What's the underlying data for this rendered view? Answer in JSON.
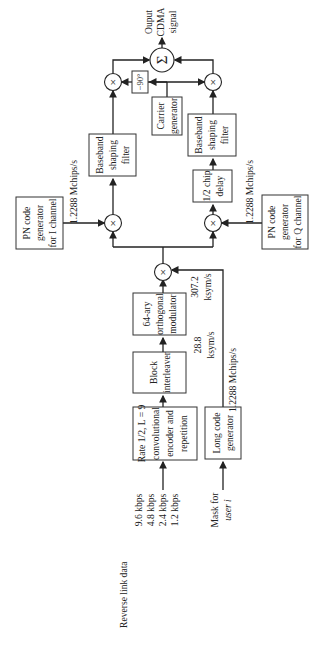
{
  "diagram": {
    "inputs": {
      "reverse_link_label": "Reverse link data",
      "rates": [
        "9.6 kbps",
        "4.8 kbps",
        "2.4 kbps",
        "1.2 kbps"
      ],
      "mask_line1": "Mask for",
      "mask_line2": "user i"
    },
    "blocks": {
      "encoder": {
        "line1": "Rate 1/2, L = 9",
        "line2": "convolutional",
        "line3": "encoder and",
        "line4": "repetition"
      },
      "long_code": {
        "line1": "Long code",
        "line2": "generator"
      },
      "interleaver": {
        "line1": "Block",
        "line2": "interleaver"
      },
      "modulator": {
        "line1": "64-ary",
        "line2": "orthogonal",
        "line3": "modulator"
      },
      "pn_i": {
        "line1": "PN code",
        "line2": "generator",
        "line3": "for I channel"
      },
      "pn_q": {
        "line1": "PN code",
        "line2": "generator",
        "line3": "for Q channel"
      },
      "bb_i": {
        "line1": "Baseband",
        "line2": "shaping",
        "line3": "filter"
      },
      "bb_q": {
        "line1": "Baseband",
        "line2": "shaping",
        "line3": "filter"
      },
      "delay": {
        "line1": "1/2 chip",
        "line2": "delay"
      },
      "carrier": {
        "line1": "Carrier",
        "line2": "generator"
      },
      "phase": {
        "label": "−90°"
      }
    },
    "rates": {
      "interleaver_out_1": "28.8",
      "interleaver_out_2": "ksym/s",
      "modulator_out_1": "307.2",
      "modulator_out_2": "ksym/s",
      "long_code_rate": "1.2288 Mchips/s",
      "pn_i_rate": "1.2288 Mchips/s",
      "pn_q_rate": "1.2288 Mchips/s"
    },
    "symbols": {
      "multiply": "×",
      "sum": "Σ"
    },
    "output": {
      "line1": "Ouput",
      "line2": "CDMA",
      "line3": "signal"
    }
  }
}
